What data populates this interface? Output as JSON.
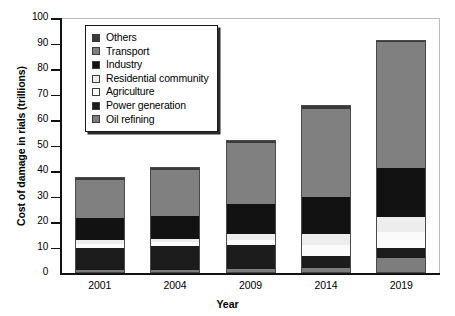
{
  "chart_data": {
    "type": "bar",
    "stacked": true,
    "title": "",
    "xlabel": "Year",
    "ylabel": "Cost of damage in rials (trillions)",
    "categories": [
      "2001",
      "2004",
      "2009",
      "2014",
      "2019"
    ],
    "ylim": [
      0,
      100
    ],
    "yticks": [
      0,
      10,
      20,
      30,
      40,
      50,
      60,
      70,
      80,
      90,
      100
    ],
    "grid": false,
    "legend_position": "top-left-inside",
    "series": [
      {
        "name": "Oil refining",
        "color": "#7d7d7d",
        "values": [
          1.0,
          1.0,
          1.5,
          2.0,
          6.0
        ]
      },
      {
        "name": "Power generation",
        "color": "#1c1c1c",
        "values": [
          9.0,
          9.5,
          9.5,
          4.5,
          4.0
        ]
      },
      {
        "name": "Agriculture",
        "color": "#fbfbfb",
        "values": [
          1.5,
          1.5,
          2.0,
          4.5,
          6.0
        ]
      },
      {
        "name": "Residential community",
        "color": "#ededed",
        "values": [
          1.5,
          1.5,
          2.5,
          4.5,
          6.0
        ]
      },
      {
        "name": "Industry",
        "color": "#121212",
        "values": [
          8.5,
          9.0,
          11.5,
          14.5,
          19.0
        ]
      },
      {
        "name": "Transport",
        "color": "#808080",
        "values": [
          15.0,
          18.0,
          24.0,
          34.5,
          49.5
        ]
      },
      {
        "name": "Others",
        "color": "#3a3a3a",
        "values": [
          1.0,
          1.0,
          1.0,
          1.5,
          1.0
        ]
      }
    ],
    "totals": [
      37.5,
      41.5,
      52.0,
      66.0,
      91.5
    ]
  },
  "legend": {
    "items": [
      {
        "label": "Others",
        "color": "#3a3a3a"
      },
      {
        "label": "Transport",
        "color": "#808080"
      },
      {
        "label": "Industry",
        "color": "#121212"
      },
      {
        "label": "Residential community",
        "color": "#ededed"
      },
      {
        "label": "Agriculture",
        "color": "#fbfbfb"
      },
      {
        "label": "Power generation",
        "color": "#1c1c1c"
      },
      {
        "label": "Oil refining",
        "color": "#7d7d7d"
      }
    ]
  }
}
